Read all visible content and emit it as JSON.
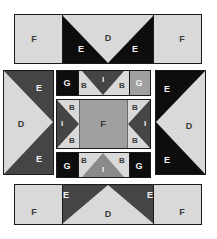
{
  "diagram": {
    "canvas": {
      "width": 217,
      "height": 239,
      "background": "#ffffff"
    },
    "palette": {
      "light": "#d9d9d9",
      "light_edge": "#cfcfcf",
      "medium": "#a0a0a0",
      "medium_dark": "#707070",
      "dark": "#454545",
      "black": "#0d0d0d",
      "outline": "#1a1a1a",
      "label_on_dark": "#f2f2f2",
      "label_on_light": "#3a3a3a"
    },
    "patch_codes": [
      "B",
      "D",
      "E",
      "F",
      "G",
      "I"
    ],
    "units": [
      {
        "name": "top-border-strip",
        "x": 14,
        "y": 14,
        "w": 188,
        "h": 50,
        "patches": [
          {
            "code": "F",
            "fill": "light",
            "label_x": 34,
            "label_y": 39
          },
          {
            "code": "E",
            "fill": "black",
            "label_x": 81,
            "label_y": 49
          },
          {
            "code": "D",
            "fill": "light",
            "label_x": 108,
            "label_y": 38
          },
          {
            "code": "E",
            "fill": "black",
            "label_x": 135,
            "label_y": 49
          },
          {
            "code": "F",
            "fill": "light",
            "label_x": 182,
            "label_y": 39
          }
        ]
      },
      {
        "name": "left-side-unit",
        "x": 3,
        "y": 70,
        "w": 51,
        "h": 105,
        "patches": [
          {
            "code": "E",
            "fill": "dark",
            "label_x": 38,
            "label_y": 88
          },
          {
            "code": "D",
            "fill": "light",
            "label_x": 22,
            "label_y": 124
          },
          {
            "code": "E",
            "fill": "dark",
            "label_x": 38,
            "label_y": 159
          }
        ]
      },
      {
        "name": "right-side-unit",
        "x": 155,
        "y": 70,
        "w": 51,
        "h": 105,
        "patches": [
          {
            "code": "E",
            "fill": "black",
            "label_x": 166,
            "label_y": 89
          },
          {
            "code": "D",
            "fill": "light",
            "label_x": 189,
            "label_y": 126
          },
          {
            "code": "E",
            "fill": "black",
            "label_x": 166,
            "label_y": 160
          }
        ]
      },
      {
        "name": "center-top-strip",
        "x": 56,
        "y": 70,
        "w": 95,
        "h": 26,
        "patches": [
          {
            "code": "G",
            "fill": "black",
            "label_x": 67,
            "label_y": 83
          },
          {
            "code": "B",
            "fill": "light",
            "label_x": 83,
            "label_y": 86
          },
          {
            "code": "I",
            "fill": "dark",
            "label_x": 103,
            "label_y": 80
          },
          {
            "code": "B",
            "fill": "light",
            "label_x": 121,
            "label_y": 86
          },
          {
            "code": "G",
            "fill": "medium",
            "label_x": 139,
            "label_y": 83
          }
        ]
      },
      {
        "name": "center-middle-strip",
        "x": 56,
        "y": 99,
        "w": 95,
        "h": 50,
        "patches": [
          {
            "code": "B",
            "fill": "light",
            "label_x": 71,
            "label_y": 108
          },
          {
            "code": "I",
            "fill": "dark",
            "label_x": 62,
            "label_y": 124
          },
          {
            "code": "B",
            "fill": "light",
            "label_x": 71,
            "label_y": 140
          },
          {
            "code": "F",
            "fill": "medium",
            "label_x": 103,
            "label_y": 124
          },
          {
            "code": "B",
            "fill": "light",
            "label_x": 135,
            "label_y": 108
          },
          {
            "code": "I",
            "fill": "dark",
            "label_x": 144,
            "label_y": 124
          },
          {
            "code": "B",
            "fill": "light",
            "label_x": 135,
            "label_y": 140
          }
        ]
      },
      {
        "name": "center-bottom-strip",
        "x": 56,
        "y": 152,
        "w": 95,
        "h": 26,
        "patches": [
          {
            "code": "G",
            "fill": "black",
            "label_x": 67,
            "label_y": 165
          },
          {
            "code": "B",
            "fill": "light",
            "label_x": 83,
            "label_y": 161
          },
          {
            "code": "I",
            "fill": "medium",
            "label_x": 103,
            "label_y": 169
          },
          {
            "code": "B",
            "fill": "light",
            "label_x": 121,
            "label_y": 161
          },
          {
            "code": "G",
            "fill": "black",
            "label_x": 139,
            "label_y": 165
          }
        ]
      },
      {
        "name": "bottom-border-strip",
        "x": 14,
        "y": 184,
        "w": 188,
        "h": 41,
        "patches": [
          {
            "code": "F",
            "fill": "light",
            "label_x": 34,
            "label_y": 212
          },
          {
            "code": "E",
            "fill": "dark",
            "label_x": 66,
            "label_y": 195
          },
          {
            "code": "D",
            "fill": "light",
            "label_x": 108,
            "label_y": 214
          },
          {
            "code": "E",
            "fill": "dark",
            "label_x": 150,
            "label_y": 195
          },
          {
            "code": "F",
            "fill": "light",
            "label_x": 182,
            "label_y": 212
          }
        ]
      }
    ],
    "labels": {
      "top_F_left": "F",
      "top_E_left": "E",
      "top_D": "D",
      "top_E_right": "E",
      "top_F_right": "F",
      "left_E_top": "E",
      "left_D": "D",
      "left_E_bottom": "E",
      "right_E_top": "E",
      "right_D": "D",
      "right_E_bottom": "E",
      "ct_G_left": "G",
      "ct_B_left": "B",
      "ct_I": "I",
      "ct_B_right": "B",
      "ct_G_right": "G",
      "cm_B_tl": "B",
      "cm_I_left": "I",
      "cm_B_bl": "B",
      "cm_F": "F",
      "cm_B_tr": "B",
      "cm_I_right": "I",
      "cm_B_br": "B",
      "cb_G_left": "G",
      "cb_B_left": "B",
      "cb_I": "I",
      "cb_B_right": "B",
      "cb_G_right": "G",
      "bot_F_left": "F",
      "bot_E_left": "E",
      "bot_D": "D",
      "bot_E_right": "E",
      "bot_F_right": "F"
    }
  }
}
